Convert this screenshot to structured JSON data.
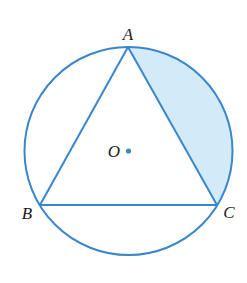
{
  "diagram": {
    "type": "geometry",
    "colors": {
      "stroke": "#3a86cc",
      "shade": "#d3ebf8",
      "label": "#1a1a1a",
      "center_dot": "#3a86cc"
    },
    "circle": {
      "center": [
        128.5,
        151
      ],
      "radius": 104
    },
    "points": {
      "A": {
        "label": "A",
        "x": 128,
        "y": 47,
        "label_x": 128,
        "label_y": 40
      },
      "B": {
        "label": "B",
        "x": 40,
        "y": 205,
        "label_x": 26,
        "label_y": 219
      },
      "C": {
        "label": "C",
        "x": 217,
        "y": 205,
        "label_x": 229,
        "label_y": 218
      },
      "O": {
        "label": "O",
        "x": 128.5,
        "y": 151,
        "label_x": 114,
        "label_y": 157
      }
    },
    "shaded_region": "segment between chord AC and minor arc AC"
  }
}
